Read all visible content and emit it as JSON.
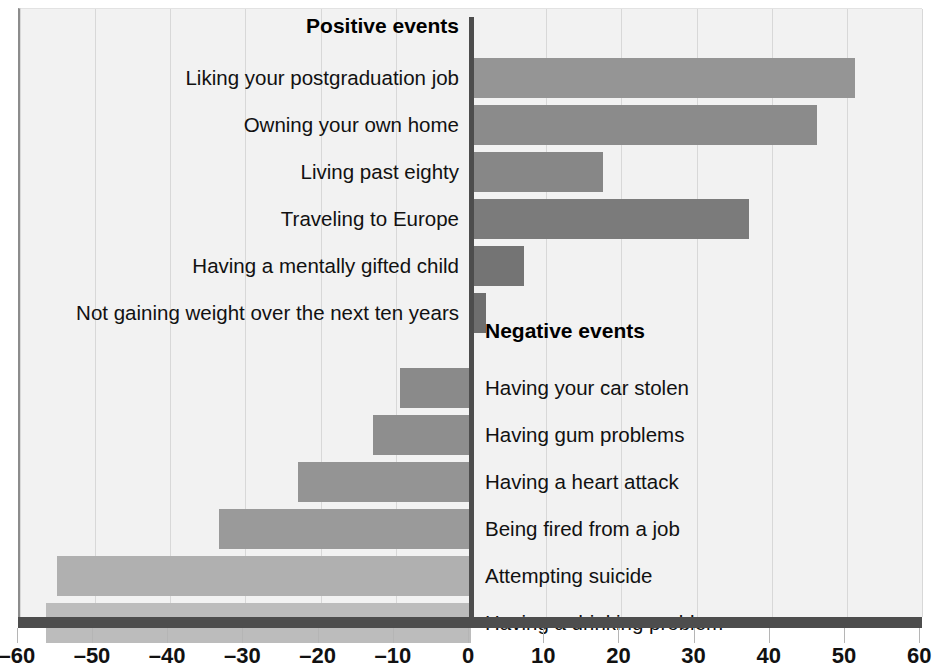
{
  "chart_data": {
    "type": "bar",
    "title": "",
    "orientation": "horizontal",
    "xlabel": "",
    "ylabel": "",
    "xlim": [
      -60,
      60
    ],
    "xticks": [
      -60,
      -50,
      -40,
      -30,
      -20,
      -10,
      0,
      10,
      20,
      30,
      40,
      50,
      60
    ],
    "xtick_labels": [
      "–60",
      "–50",
      "–40",
      "–30",
      "–20",
      "–10",
      "0",
      "10",
      "20",
      "30",
      "40",
      "50",
      "60"
    ],
    "grid": true,
    "legend": "none",
    "sections": [
      {
        "heading": "Positive events",
        "categories": [
          "Liking your postgraduation job",
          "Owning your own home",
          "Living past eighty",
          "Traveling to Europe",
          "Having a mentally gifted child",
          "Not gaining weight over the next ten years"
        ],
        "values": [
          51,
          46,
          17.5,
          37,
          7,
          2
        ],
        "bar_colors": [
          "#959595",
          "#8b8b8b",
          "#878787",
          "#7b7b7b",
          "#747474",
          "#6e6e6e"
        ]
      },
      {
        "heading": "Negative events",
        "categories": [
          "Having your car stolen",
          "Having gum problems",
          "Having a heart attack",
          "Being fired from a job",
          "Attempting suicide",
          "Having a drinking problem"
        ],
        "values": [
          -9.5,
          -13,
          -23,
          -33.5,
          -55,
          -56.5
        ],
        "bar_colors": [
          "#8a8a8a",
          "#8e8e8e",
          "#949494",
          "#9a9a9a",
          "#b0b0b0",
          "#bcbcbc"
        ]
      }
    ],
    "colors": {
      "plot_background": "#f2f2f2",
      "axis": "#4d4d4d",
      "gridline": "#d8d8d8",
      "text": "#111111"
    }
  }
}
